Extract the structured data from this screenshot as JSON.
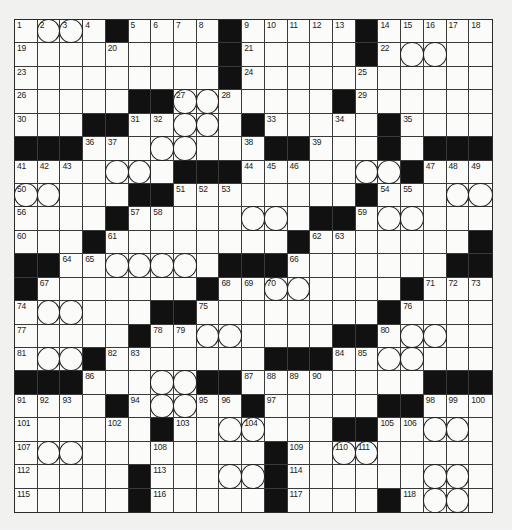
{
  "puzzle": {
    "rows": 21,
    "cols": 21,
    "legend": {
      "black": "#",
      "white": ".",
      "circled": "o"
    },
    "pattern": [
      ".oo.#....#.....#.....",
      ".........#.....#.oo..",
      ".........#...........",
      ".....##oo.....#......",
      "...##..oo.#.....#....",
      "###...oo...##...#.###",
      "....oo.###.....oo#...",
      "oo...##........#...oo",
      "....#.....oo.##.oo...",
      "...#........#.......#",
      "##..oooo.###.......##",
      "#.......#..oo....#...",
      ".oo...##........#....",
      ".....#..oo....##.oo..",
      ".oo#.......###..oo...",
      "###...oo##........###",
      "....#.oo..#.....##...",
      "......#..oo...##..oo.",
      ".oo........#..oo.....",
      ".....#...oo#......oo.",
      ".....#.....#....#.oo."
    ],
    "numbers": [
      [
        1,
        2,
        3,
        4,
        null,
        5,
        6,
        7,
        8,
        null,
        9,
        10,
        11,
        12,
        13,
        null,
        14,
        15,
        16,
        17,
        18
      ],
      [
        19,
        null,
        null,
        null,
        20,
        null,
        null,
        null,
        null,
        null,
        21,
        null,
        null,
        null,
        null,
        null,
        22,
        null,
        null,
        null,
        null
      ],
      [
        23,
        null,
        null,
        null,
        null,
        null,
        null,
        null,
        null,
        null,
        24,
        null,
        null,
        null,
        null,
        25,
        null,
        null,
        null,
        null,
        null
      ],
      [
        26,
        null,
        null,
        null,
        null,
        null,
        null,
        27,
        null,
        28,
        null,
        null,
        null,
        null,
        null,
        29,
        null,
        null,
        null,
        null,
        null
      ],
      [
        30,
        null,
        null,
        null,
        null,
        31,
        32,
        null,
        null,
        null,
        null,
        33,
        null,
        null,
        34,
        null,
        null,
        35,
        null,
        null,
        null
      ],
      [
        null,
        null,
        null,
        36,
        37,
        null,
        null,
        null,
        null,
        null,
        38,
        null,
        null,
        39,
        null,
        null,
        40,
        null,
        null,
        null,
        null
      ],
      [
        41,
        42,
        43,
        null,
        null,
        null,
        null,
        null,
        null,
        null,
        44,
        45,
        46,
        null,
        null,
        null,
        null,
        null,
        47,
        48,
        49
      ],
      [
        50,
        null,
        null,
        null,
        null,
        null,
        null,
        51,
        52,
        53,
        null,
        null,
        null,
        null,
        null,
        null,
        54,
        55,
        null,
        null,
        null
      ],
      [
        56,
        null,
        null,
        null,
        null,
        57,
        58,
        null,
        null,
        null,
        null,
        null,
        null,
        null,
        null,
        59,
        null,
        null,
        null,
        null,
        null
      ],
      [
        60,
        null,
        null,
        null,
        61,
        null,
        null,
        null,
        null,
        null,
        null,
        null,
        null,
        62,
        63,
        null,
        null,
        null,
        null,
        null,
        null
      ],
      [
        null,
        null,
        64,
        65,
        null,
        null,
        null,
        null,
        null,
        null,
        null,
        null,
        66,
        null,
        null,
        null,
        null,
        null,
        null,
        null,
        null
      ],
      [
        null,
        67,
        null,
        null,
        null,
        null,
        null,
        null,
        null,
        68,
        69,
        70,
        null,
        null,
        null,
        null,
        null,
        null,
        71,
        72,
        73
      ],
      [
        74,
        null,
        null,
        null,
        null,
        null,
        null,
        null,
        75,
        null,
        null,
        null,
        null,
        null,
        null,
        null,
        null,
        76,
        null,
        null,
        null
      ],
      [
        77,
        null,
        null,
        null,
        null,
        null,
        78,
        79,
        null,
        null,
        null,
        null,
        null,
        null,
        null,
        null,
        80,
        null,
        null,
        null,
        null
      ],
      [
        81,
        null,
        null,
        null,
        82,
        83,
        null,
        null,
        null,
        null,
        null,
        null,
        null,
        null,
        84,
        85,
        null,
        null,
        null,
        null,
        null
      ],
      [
        null,
        null,
        null,
        86,
        null,
        null,
        null,
        null,
        null,
        null,
        87,
        88,
        89,
        90,
        null,
        null,
        null,
        null,
        null,
        null,
        null
      ],
      [
        91,
        92,
        93,
        null,
        null,
        94,
        null,
        null,
        95,
        96,
        null,
        97,
        null,
        null,
        null,
        null,
        null,
        null,
        98,
        99,
        100
      ],
      [
        101,
        null,
        null,
        null,
        102,
        null,
        null,
        103,
        null,
        null,
        104,
        null,
        null,
        null,
        null,
        null,
        105,
        106,
        null,
        null,
        null
      ],
      [
        107,
        null,
        null,
        null,
        null,
        null,
        108,
        null,
        null,
        null,
        null,
        null,
        109,
        null,
        110,
        111,
        null,
        null,
        null,
        null,
        null
      ],
      [
        112,
        null,
        null,
        null,
        null,
        null,
        113,
        null,
        null,
        null,
        null,
        null,
        114,
        null,
        null,
        null,
        null,
        null,
        null,
        null,
        null
      ],
      [
        115,
        null,
        null,
        null,
        null,
        null,
        116,
        null,
        null,
        null,
        null,
        null,
        117,
        null,
        null,
        null,
        null,
        118,
        null,
        null,
        null
      ]
    ],
    "letters": []
  }
}
